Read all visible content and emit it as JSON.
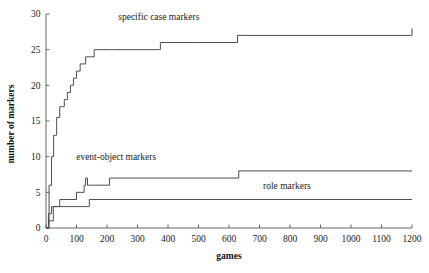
{
  "chart_data": {
    "type": "line",
    "title": "",
    "xlabel": "games",
    "ylabel": "number of markers",
    "xlim": [
      0,
      1200
    ],
    "ylim": [
      0,
      30
    ],
    "xticks": [
      0,
      100,
      200,
      300,
      400,
      500,
      600,
      700,
      800,
      900,
      1000,
      1100,
      1200
    ],
    "yticks": [
      0,
      5,
      10,
      15,
      20,
      25,
      30
    ],
    "grid": false,
    "legend_position": "inline-annotations",
    "annotations": [
      {
        "text": "specific case markers",
        "x": 370,
        "y": 29.2
      },
      {
        "text": "event-object markers",
        "x": 230,
        "y": 9.6
      },
      {
        "text": "role markers",
        "x": 790,
        "y": 5.4
      }
    ],
    "series": [
      {
        "name": "specific case markers",
        "step": "post",
        "final_value": 28,
        "points": [
          [
            0,
            0
          ],
          [
            10,
            6
          ],
          [
            18,
            10
          ],
          [
            25,
            13
          ],
          [
            35,
            15.5
          ],
          [
            45,
            17
          ],
          [
            55,
            17
          ],
          [
            60,
            18
          ],
          [
            70,
            19
          ],
          [
            80,
            20
          ],
          [
            90,
            21
          ],
          [
            100,
            22
          ],
          [
            108,
            22
          ],
          [
            112,
            23
          ],
          [
            125,
            23
          ],
          [
            130,
            24
          ],
          [
            150,
            24
          ],
          [
            158,
            25
          ],
          [
            215,
            25
          ],
          [
            218,
            25
          ],
          [
            370,
            25
          ],
          [
            375,
            26
          ],
          [
            500,
            26
          ],
          [
            505,
            26
          ],
          [
            620,
            26
          ],
          [
            628,
            27
          ],
          [
            640,
            27
          ],
          [
            1200,
            28
          ]
        ]
      },
      {
        "name": "event-object markers",
        "step": "post",
        "final_value": 8,
        "points": [
          [
            0,
            0
          ],
          [
            8,
            2
          ],
          [
            18,
            3
          ],
          [
            22,
            3
          ],
          [
            40,
            3
          ],
          [
            45,
            4
          ],
          [
            95,
            4
          ],
          [
            100,
            5
          ],
          [
            118,
            5
          ],
          [
            125,
            6
          ],
          [
            130,
            7
          ],
          [
            136,
            6
          ],
          [
            142,
            6
          ],
          [
            200,
            6
          ],
          [
            208,
            7
          ],
          [
            215,
            7
          ],
          [
            620,
            7
          ],
          [
            632,
            8
          ],
          [
            1200,
            8
          ]
        ]
      },
      {
        "name": "role markers",
        "step": "post",
        "final_value": 4,
        "points": [
          [
            0,
            0
          ],
          [
            8,
            1
          ],
          [
            20,
            1
          ],
          [
            24,
            3
          ],
          [
            60,
            3
          ],
          [
            100,
            3
          ],
          [
            130,
            3
          ],
          [
            138,
            3
          ],
          [
            142,
            4
          ],
          [
            200,
            4
          ],
          [
            1200,
            4
          ]
        ]
      }
    ]
  },
  "axes": {
    "y_tick_labels": [
      "0",
      "5",
      "10",
      "15",
      "20",
      "25",
      "30"
    ],
    "x_tick_labels": [
      "0",
      "100",
      "200",
      "300",
      "400",
      "500",
      "600",
      "700",
      "800",
      "900",
      "1000",
      "1100",
      "1200"
    ],
    "x_title": "games",
    "y_title": "number of markers"
  }
}
